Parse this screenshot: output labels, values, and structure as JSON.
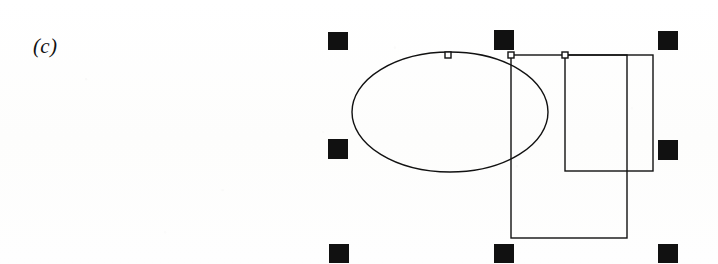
{
  "canvas": {
    "width": 718,
    "height": 264,
    "background_color": "#fdfdfd",
    "ink_color": "#111111"
  },
  "figure": {
    "label": "(c)",
    "label_x": 33,
    "label_y": 34,
    "label_font_size": 21
  },
  "drawing": {
    "title": "vector-drawing-canvas",
    "stroke_color": "#111111",
    "stroke_width": 1.4,
    "fill": "none",
    "shapes": [
      {
        "name": "ellipse",
        "type": "ellipse",
        "cx": 450,
        "cy": 112,
        "rx": 98,
        "ry": 60
      },
      {
        "name": "tall-rectangle",
        "type": "rect",
        "x": 511,
        "y": 55,
        "width": 116,
        "height": 183
      },
      {
        "name": "wide-rectangle",
        "type": "rect",
        "x": 565,
        "y": 55,
        "width": 88,
        "height": 116
      }
    ],
    "vertex_markers": [
      {
        "name": "vertex-marker-ellipse-top",
        "cx": 448,
        "cy": 55,
        "size": 6
      },
      {
        "name": "vertex-marker-tall-rect-topleft",
        "cx": 511,
        "cy": 55,
        "size": 6
      },
      {
        "name": "vertex-marker-wide-rect-topleft",
        "cx": 565,
        "cy": 55,
        "size": 6
      }
    ]
  },
  "selection": {
    "name": "selection-handles",
    "handle_color": "#111111",
    "handle_width": 20,
    "handle_height": 19,
    "handles": [
      {
        "name": "selection-handle-top-left",
        "x": 328,
        "y": 32,
        "w": 20,
        "h": 18
      },
      {
        "name": "selection-handle-top-center",
        "x": 494,
        "y": 30,
        "w": 20,
        "h": 20
      },
      {
        "name": "selection-handle-top-right",
        "x": 658,
        "y": 31,
        "w": 20,
        "h": 19
      },
      {
        "name": "selection-handle-middle-left",
        "x": 328,
        "y": 139,
        "w": 20,
        "h": 20
      },
      {
        "name": "selection-handle-middle-right",
        "x": 658,
        "y": 140,
        "w": 20,
        "h": 20
      },
      {
        "name": "selection-handle-bottom-left",
        "x": 329,
        "y": 244,
        "w": 20,
        "h": 19
      },
      {
        "name": "selection-handle-bottom-center",
        "x": 494,
        "y": 244,
        "w": 20,
        "h": 19
      },
      {
        "name": "selection-handle-bottom-right",
        "x": 658,
        "y": 244,
        "w": 20,
        "h": 19
      }
    ]
  }
}
